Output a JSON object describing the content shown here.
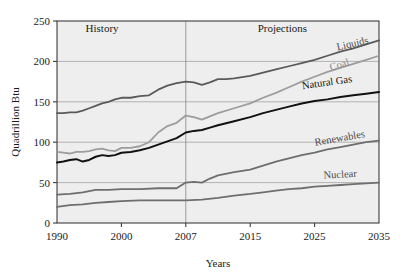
{
  "chart_data": {
    "type": "line",
    "title": "",
    "xlabel": "Years",
    "ylabel": "Quadrillion Btu",
    "ylim": [
      0,
      250
    ],
    "yticks": [
      0,
      50,
      100,
      150,
      200,
      250
    ],
    "xticks": [
      1990,
      2000,
      2007,
      2015,
      2025,
      2035
    ],
    "xtick_labels": [
      "1990",
      "2000",
      "2007",
      "2015",
      "2025",
      "2035"
    ],
    "ytick_labels": [
      "0",
      "50",
      "100",
      "150",
      "200",
      "250"
    ],
    "grid": "horizontal",
    "legend": "inline-labels-at-right",
    "annotations": [
      {
        "text": "History",
        "x": 1997,
        "y": 237
      },
      {
        "text": "Projections",
        "x": 2020,
        "y": 237
      }
    ],
    "divider_year": 2007,
    "series": [
      {
        "name": "Liquids",
        "color": "#5a5a5a",
        "label_anchor": {
          "x": 2031,
          "y": 218
        },
        "x": [
          1990,
          1991,
          1992,
          1993,
          1994,
          1995,
          1996,
          1997,
          1998,
          1999,
          2000,
          2001,
          2002,
          2003,
          2004,
          2005,
          2006,
          2007,
          2008,
          2009,
          2010,
          2011,
          2012,
          2013,
          2015,
          2017,
          2019,
          2021,
          2023,
          2025,
          2027,
          2029,
          2031,
          2033,
          2035
        ],
        "values": [
          136,
          136,
          137,
          137,
          139,
          142,
          145,
          148,
          150,
          153,
          155,
          155,
          157,
          158,
          165,
          170,
          173,
          175,
          174,
          171,
          174,
          178,
          178,
          179,
          182,
          186,
          190,
          194,
          198,
          202,
          207,
          212,
          216,
          221,
          226
        ]
      },
      {
        "name": "Coal",
        "color": "#9d9d9d",
        "label_anchor": {
          "x": 2029,
          "y": 192
        },
        "x": [
          1990,
          1991,
          1992,
          1993,
          1994,
          1995,
          1996,
          1997,
          1998,
          1999,
          2000,
          2001,
          2002,
          2003,
          2004,
          2005,
          2006,
          2007,
          2008,
          2009,
          2010,
          2011,
          2013,
          2015,
          2017,
          2019,
          2021,
          2023,
          2025,
          2027,
          2029,
          2031,
          2033,
          2035
        ],
        "values": [
          88,
          87,
          86,
          88,
          88,
          89,
          91,
          92,
          90,
          89,
          93,
          93,
          95,
          100,
          112,
          120,
          124,
          133,
          131,
          128,
          132,
          136,
          142,
          148,
          155,
          161,
          168,
          175,
          181,
          187,
          192,
          197,
          202,
          207
        ]
      },
      {
        "name": "Natural Gas",
        "color": "#111111",
        "label_anchor": {
          "x": 2027,
          "y": 170
        },
        "x": [
          1990,
          1991,
          1992,
          1993,
          1994,
          1995,
          1996,
          1997,
          1998,
          1999,
          2000,
          2001,
          2002,
          2003,
          2004,
          2005,
          2006,
          2007,
          2008,
          2009,
          2010,
          2011,
          2013,
          2015,
          2017,
          2019,
          2021,
          2023,
          2025,
          2027,
          2029,
          2031,
          2033,
          2035
        ],
        "values": [
          75,
          76,
          78,
          79,
          76,
          78,
          82,
          84,
          83,
          84,
          87,
          88,
          90,
          93,
          97,
          101,
          105,
          112,
          114,
          115,
          118,
          121,
          126,
          131,
          136,
          140,
          144,
          148,
          151,
          153,
          156,
          158,
          160,
          162
        ]
      },
      {
        "name": "Renewables",
        "color": "#6e6e6e",
        "label_anchor": {
          "x": 2029,
          "y": 101
        },
        "x": [
          1990,
          1992,
          1994,
          1996,
          1998,
          2000,
          2002,
          2004,
          2006,
          2007,
          2008,
          2009,
          2010,
          2011,
          2013,
          2015,
          2017,
          2019,
          2021,
          2023,
          2025,
          2027,
          2029,
          2031,
          2033,
          2035
        ],
        "values": [
          35,
          36,
          38,
          41,
          41,
          42,
          42,
          43,
          43,
          50,
          51,
          50,
          55,
          59,
          63,
          66,
          71,
          76,
          80,
          84,
          87,
          91,
          94,
          97,
          100,
          102
        ]
      },
      {
        "name": "Nuclear",
        "color": "#6e6e6e",
        "label_anchor": {
          "x": 2029,
          "y": 56
        },
        "x": [
          1990,
          1992,
          1994,
          1996,
          1998,
          2000,
          2002,
          2004,
          2006,
          2007,
          2009,
          2011,
          2013,
          2015,
          2017,
          2019,
          2021,
          2023,
          2025,
          2027,
          2029,
          2031,
          2033,
          2035
        ],
        "values": [
          20,
          22,
          23,
          25,
          26,
          27,
          28,
          28,
          28,
          28,
          29,
          31,
          34,
          36,
          38,
          40,
          42,
          43,
          45,
          46,
          47,
          48,
          49,
          50
        ]
      }
    ]
  }
}
